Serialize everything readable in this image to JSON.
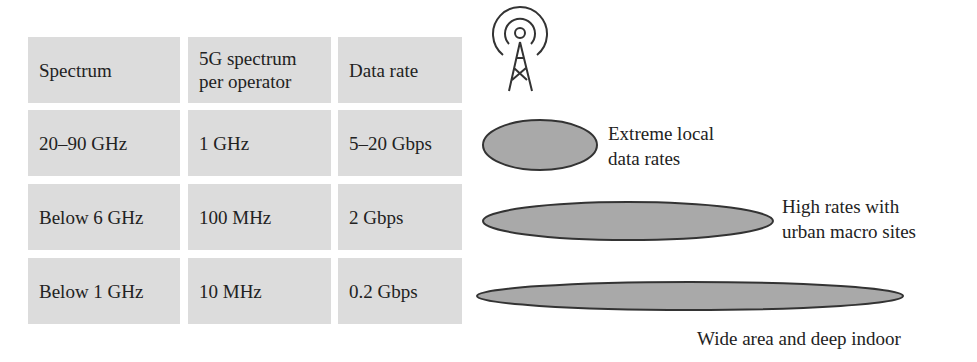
{
  "table": {
    "headers": [
      "Spectrum",
      "5G spectrum per operator",
      "Data rate"
    ],
    "header_lines": {
      "col2_line1": "5G spectrum",
      "col2_line2": "per operator"
    },
    "rows": [
      [
        "20–90 GHz",
        "1 GHz",
        "5–20 Gbps"
      ],
      [
        "Below 6 GHz",
        "100 MHz",
        "2 Gbps"
      ],
      [
        "Below 1 GHz",
        "10 MHz",
        "0.2 Gbps"
      ]
    ]
  },
  "diagram": {
    "icon": "cell-tower-icon",
    "coverage": [
      {
        "line1": "Extreme local",
        "line2": "data rates"
      },
      {
        "line1": "High rates with",
        "line2": "urban macro sites"
      },
      {
        "line1": "Wide area and deep indoor"
      }
    ]
  },
  "colors": {
    "cell_bg": "#dcdcdc",
    "ellipse_fill": "#a9a9a9",
    "stroke": "#333333"
  }
}
